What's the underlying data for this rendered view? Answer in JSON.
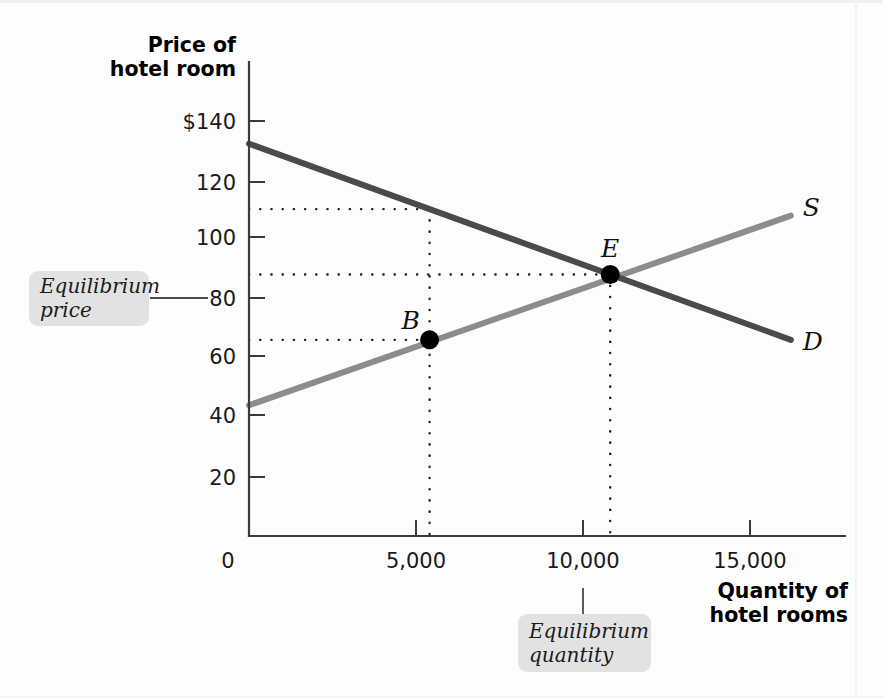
{
  "axes": {
    "y_title_line1": "Price of",
    "y_title_line2": "hotel room",
    "x_title_line1": "Quantity of",
    "x_title_line2": "hotel rooms",
    "origin_label": "0"
  },
  "callouts": {
    "price": {
      "line1": "Equilibrium",
      "line2": "price"
    },
    "quantity": {
      "line1": "Equilibrium",
      "line2": "quantity"
    }
  },
  "curve_labels": {
    "supply": "S",
    "demand": "D"
  },
  "point_labels": {
    "equilibrium": "E",
    "b": "B"
  },
  "colors": {
    "demand": "#4a4a4a",
    "supply": "#8c8c8c",
    "axis": "#3b3b3b",
    "callout_bg": "#e2e2e2",
    "marker": "#000000"
  },
  "chart_data": {
    "type": "line",
    "xlabel": "Quantity of hotel rooms",
    "ylabel": "Price of hotel room",
    "xlim": [
      0,
      16500
    ],
    "ylim": [
      0,
      145
    ],
    "grid": false,
    "legend": "inline-curve-labels",
    "x_ticks": [
      0,
      5000,
      10000,
      15000
    ],
    "x_tick_labels": [
      "0",
      "5,000",
      "10,000",
      "15,000"
    ],
    "y_ticks": [
      20,
      40,
      60,
      80,
      100,
      120,
      140
    ],
    "y_tick_labels": [
      "20",
      "40",
      "60",
      "80",
      "100",
      "120",
      "$140"
    ],
    "series": [
      {
        "name": "D",
        "label": "Demand",
        "color": "#4a4a4a",
        "x": [
          0,
          15000
        ],
        "y": [
          120,
          60
        ]
      },
      {
        "name": "S",
        "label": "Supply",
        "color": "#8c8c8c",
        "x": [
          0,
          15000
        ],
        "y": [
          40,
          98
        ]
      }
    ],
    "points": [
      {
        "name": "E",
        "label": "E",
        "x": 10000,
        "y": 80,
        "note": "equilibrium"
      },
      {
        "name": "B",
        "label": "B",
        "x": 5000,
        "y": 60,
        "note": "quantity supplied at price 60"
      }
    ],
    "annotations": [
      {
        "text": "Equilibrium price",
        "target_y": 80
      },
      {
        "text": "Equilibrium quantity",
        "target_x": 10000
      }
    ],
    "guides": [
      {
        "type": "horizontal",
        "y": 100,
        "from_x": 0,
        "to_x": 5000
      },
      {
        "type": "horizontal",
        "y": 80,
        "from_x": 0,
        "to_x": 10000
      },
      {
        "type": "horizontal",
        "y": 60,
        "from_x": 0,
        "to_x": 5000
      },
      {
        "type": "vertical",
        "x": 5000,
        "from_y": 0,
        "to_y": 100
      },
      {
        "type": "vertical",
        "x": 10000,
        "from_y": 0,
        "to_y": 80
      }
    ]
  }
}
